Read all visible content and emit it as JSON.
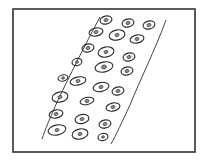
{
  "figure": {
    "description": "Hand-drawn sketch of a curved tissue strip containing oval cells with nuclei",
    "frame": {
      "x": 13,
      "y": 9,
      "width": 182,
      "height": 143,
      "stroke": "#333333"
    },
    "strip": {
      "left_edge": "M100,17 C85,45 70,75 58,100 C50,118 45,130 42,139",
      "right_edge": "M166,20 C155,50 140,80 130,105 C122,122 116,135 111,144",
      "stroke": "#444444"
    },
    "cells": [
      {
        "cx": 106,
        "cy": 20,
        "rx": 6,
        "ry": 4,
        "n": 2
      },
      {
        "cx": 128,
        "cy": 23,
        "rx": 6,
        "ry": 4,
        "n": 2
      },
      {
        "cx": 149,
        "cy": 25,
        "rx": 6,
        "ry": 4,
        "n": 2
      },
      {
        "cx": 96,
        "cy": 32,
        "rx": 7,
        "ry": 4,
        "n": 2
      },
      {
        "cx": 117,
        "cy": 35,
        "rx": 8,
        "ry": 5,
        "n": 2
      },
      {
        "cx": 137,
        "cy": 39,
        "rx": 7,
        "ry": 4,
        "n": 2
      },
      {
        "cx": 88,
        "cy": 48,
        "rx": 6,
        "ry": 4,
        "n": 2
      },
      {
        "cx": 106,
        "cy": 52,
        "rx": 8,
        "ry": 5,
        "n": 2
      },
      {
        "cx": 129,
        "cy": 57,
        "rx": 6,
        "ry": 4,
        "n": 2
      },
      {
        "cx": 77,
        "cy": 62,
        "rx": 5,
        "ry": 3.5,
        "n": 1.5
      },
      {
        "cx": 104,
        "cy": 67,
        "rx": 9,
        "ry": 5,
        "n": 2.5
      },
      {
        "cx": 127,
        "cy": 71,
        "rx": 6,
        "ry": 4,
        "n": 2
      },
      {
        "cx": 63,
        "cy": 78,
        "rx": 5,
        "ry": 3,
        "n": 1.5
      },
      {
        "cx": 78,
        "cy": 81,
        "rx": 8,
        "ry": 4,
        "n": 2
      },
      {
        "cx": 101,
        "cy": 87,
        "rx": 8,
        "ry": 4.5,
        "n": 2
      },
      {
        "cx": 118,
        "cy": 91,
        "rx": 6,
        "ry": 4,
        "n": 2
      },
      {
        "cx": 60,
        "cy": 97,
        "rx": 8,
        "ry": 5,
        "n": 2
      },
      {
        "cx": 87,
        "cy": 101,
        "rx": 7,
        "ry": 3.5,
        "n": 2
      },
      {
        "cx": 113,
        "cy": 107,
        "rx": 7,
        "ry": 4,
        "n": 2
      },
      {
        "cx": 56,
        "cy": 114,
        "rx": 7,
        "ry": 4,
        "n": 2
      },
      {
        "cx": 82,
        "cy": 119,
        "rx": 7,
        "ry": 4.5,
        "n": 2
      },
      {
        "cx": 105,
        "cy": 124,
        "rx": 6,
        "ry": 4,
        "n": 2
      },
      {
        "cx": 57,
        "cy": 130,
        "rx": 9,
        "ry": 5,
        "n": 2
      },
      {
        "cx": 80,
        "cy": 134,
        "rx": 8,
        "ry": 5,
        "n": 2
      },
      {
        "cx": 103,
        "cy": 137,
        "rx": 5,
        "ry": 3.5,
        "n": 1.5
      }
    ],
    "colors": {
      "background": "#ffffff",
      "ink": "#2b2b2b"
    }
  }
}
